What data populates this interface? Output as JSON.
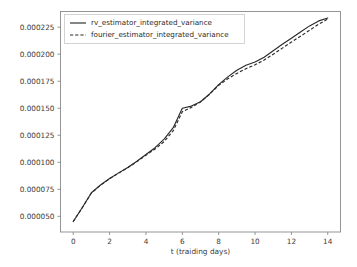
{
  "chart_data": {
    "type": "line",
    "title": "",
    "xlabel": "t (traiding days)",
    "ylabel": "",
    "xlim": [
      -0.7,
      14.7
    ],
    "ylim": [
      3.55e-05,
      0.0002395
    ],
    "xticks": [
      0,
      2,
      4,
      6,
      8,
      10,
      12,
      14
    ],
    "xticklabels": [
      "0",
      "2",
      "4",
      "6",
      "8",
      "10",
      "12",
      "14"
    ],
    "yticks": [
      5e-05,
      7.5e-05,
      0.0001,
      0.000125,
      0.00015,
      0.000175,
      0.0002,
      0.000225
    ],
    "yticklabels": [
      "0.000050",
      "0.000075",
      "0.000100",
      "0.000125",
      "0.000150",
      "0.000175",
      "0.000200",
      "0.000225"
    ],
    "grid": false,
    "legend_position": "upper left",
    "x": [
      0,
      0.5,
      1,
      1.5,
      2,
      2.5,
      3,
      3.5,
      4,
      4.5,
      5,
      5.5,
      6,
      6.5,
      7,
      7.5,
      8,
      8.5,
      9,
      9.5,
      10,
      10.5,
      11,
      11.5,
      12,
      12.5,
      13,
      13.5,
      14
    ],
    "series": [
      {
        "name": "rv_estimator_integrated_variance",
        "style": "solid",
        "color": "#2a2a2a",
        "values": [
          4.52e-05,
          5.82e-05,
          7.18e-05,
          7.9e-05,
          8.5e-05,
          9.02e-05,
          9.52e-05,
          0.000101,
          0.0001072,
          0.0001135,
          0.0001214,
          0.000132,
          0.00015,
          0.000152,
          0.000156,
          0.0001632,
          0.0001718,
          0.000179,
          0.0001852,
          0.0001898,
          0.0001928,
          0.0001972,
          0.0002032,
          0.0002092,
          0.0002148,
          0.0002206,
          0.0002262,
          0.0002308,
          0.0002335
        ]
      },
      {
        "name": "fourier_estimator_integrated_variance",
        "style": "dashed",
        "color": "#2a2a2a",
        "values": [
          4.52e-05,
          5.8e-05,
          7.16e-05,
          7.88e-05,
          8.48e-05,
          9e-05,
          9.5e-05,
          0.0001006,
          0.0001066,
          0.0001122,
          0.0001192,
          0.0001292,
          0.0001468,
          0.0001508,
          0.0001558,
          0.000163,
          0.0001712,
          0.0001772,
          0.0001822,
          0.0001866,
          0.0001902,
          0.0001946,
          0.0002,
          0.0002056,
          0.0002112,
          0.0002166,
          0.0002222,
          0.0002278,
          0.0002326
        ]
      }
    ]
  },
  "legend": {
    "entries": [
      {
        "label": "rv_estimator_integrated_variance",
        "style": "solid"
      },
      {
        "label": "fourier_estimator_integrated_variance",
        "style": "dashed"
      }
    ]
  }
}
